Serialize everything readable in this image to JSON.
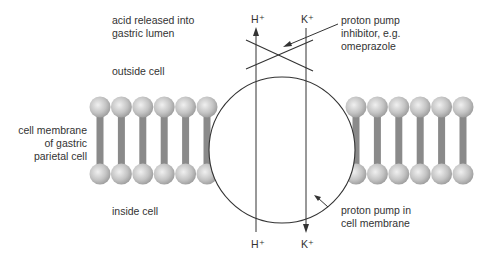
{
  "diagram": {
    "labels": {
      "acid_line1": "acid released into",
      "acid_line2": "gastric lumen",
      "outside": "outside cell",
      "inside": "inside cell",
      "membrane_line1": "cell membrane",
      "membrane_line2": "of gastric",
      "membrane_line3": "parietal cell",
      "inhibitor_line1": "proton pump",
      "inhibitor_line2": "inhibitor, e.g.",
      "inhibitor_line3": "omeprazole",
      "pump_line1": "proton pump in",
      "pump_line2": "cell membrane"
    },
    "ions": {
      "h_top": "H⁺",
      "k_top": "K⁺",
      "h_bottom": "H⁺",
      "k_bottom": "K⁺"
    },
    "flows": [
      {
        "ion": "H+",
        "direction": "up",
        "from": "inside cell",
        "to": "outside cell"
      },
      {
        "ion": "K+",
        "direction": "down",
        "from": "outside cell",
        "to": "inside cell"
      }
    ],
    "lipids_left_count": 6,
    "lipids_right_count": 6,
    "colors": {
      "line": "#333333",
      "lipid_tail": "#8a8a8a",
      "lipid_head_light": "#e6e6e6",
      "lipid_head_dark": "#a0a0a0"
    }
  }
}
